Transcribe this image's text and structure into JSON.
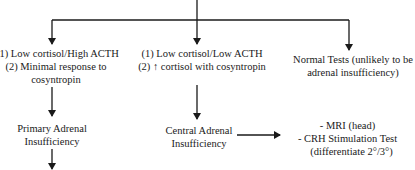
{
  "diagram": {
    "type": "flowchart",
    "nodes": {
      "primary_criteria": {
        "lines": [
          "(1) Low cortisol/High ACTH",
          "(2)  Minimal response to",
          "cosyntropin"
        ]
      },
      "central_criteria": {
        "lines": [
          "(1) Low cortisol/Low ACTH",
          "(2) ↑ cortisol with cosyntropin"
        ]
      },
      "normal_tests": {
        "lines": [
          "Normal Tests (unlikely to be",
          "adrenal insufficiency)"
        ]
      },
      "primary_ai": {
        "lines": [
          "Primary Adrenal",
          "Insufficiency"
        ]
      },
      "central_ai": {
        "lines": [
          "Central Adrenal",
          "Insufficiency"
        ]
      },
      "central_workup": {
        "lines": [
          "- MRI (head)",
          "- CRH Stimulation Test",
          "(differentiate 2°/3°)"
        ]
      }
    },
    "edges": [
      {
        "from": "top",
        "to": "primary_criteria"
      },
      {
        "from": "top",
        "to": "central_criteria"
      },
      {
        "from": "top",
        "to": "normal_tests"
      },
      {
        "from": "primary_criteria",
        "to": "primary_ai"
      },
      {
        "from": "primary_ai",
        "to": "continues-below"
      },
      {
        "from": "central_criteria",
        "to": "central_ai"
      },
      {
        "from": "central_ai",
        "to": "central_workup"
      }
    ],
    "line_color": "#1a1a1a"
  }
}
